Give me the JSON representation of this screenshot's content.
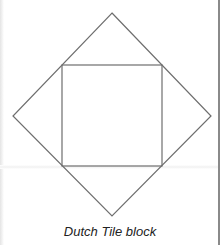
{
  "figure": {
    "caption": "Dutch Tile block",
    "outer_diamond": {
      "top": [
        112,
        13
      ],
      "right": [
        211,
        116
      ],
      "bottom": [
        112,
        216
      ],
      "left": [
        13,
        116
      ]
    },
    "inner_square": {
      "x": 62,
      "y": 65,
      "width": 100,
      "height": 101
    },
    "line_color": "#6e6e6e"
  }
}
